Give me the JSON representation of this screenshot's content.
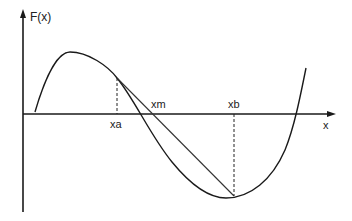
{
  "diagram": {
    "type": "function-graph-secant-method",
    "y_axis_label": "F(x)",
    "x_axis_label": "x",
    "points": {
      "xa": "xa",
      "xm": "xm",
      "xb": "xb"
    },
    "colors": {
      "axis": "#1a1a1a",
      "curve": "#1a1a1a",
      "secant": "#333333",
      "dashed": "#222222",
      "text": "#222222"
    }
  }
}
